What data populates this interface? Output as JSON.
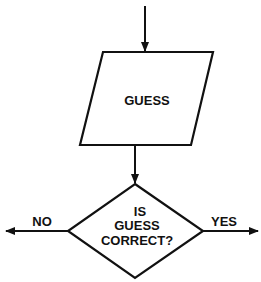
{
  "diagram": {
    "type": "flowchart",
    "colors": {
      "stroke": "#111111",
      "background": "#ffffff"
    },
    "nodes": [
      {
        "id": "guess",
        "shape": "parallelogram",
        "lines": [
          "GUESS"
        ]
      },
      {
        "id": "check",
        "shape": "diamond",
        "lines": [
          "IS",
          "GUESS",
          "CORRECT?"
        ]
      }
    ],
    "edges": [
      {
        "from": "entry",
        "to": "guess",
        "label": ""
      },
      {
        "from": "guess",
        "to": "check",
        "label": ""
      },
      {
        "from": "check",
        "to": "left-exit",
        "label": "NO"
      },
      {
        "from": "check",
        "to": "right-exit",
        "label": "YES"
      }
    ]
  }
}
